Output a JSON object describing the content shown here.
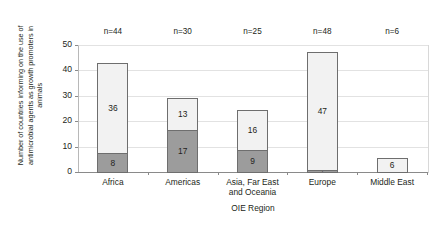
{
  "chart_data": {
    "type": "bar",
    "subtype": "stacked-column",
    "title": "",
    "xlabel": "OIE Region",
    "ylabel": "Number of countries informing on the use of antimicrobial agents as growth promoters in animals",
    "ylabel_lines": [
      "Number of countries informing on the use of",
      "antimicrobial agents as growth promoters in",
      "animals"
    ],
    "categories": [
      "Africa",
      "Americas",
      "Asia, Far East and Oceania",
      "Europe",
      "Middle East"
    ],
    "category_lines": [
      [
        "Africa"
      ],
      [
        "Americas"
      ],
      [
        "Asia, Far East",
        "and Oceania"
      ],
      [
        "Europe"
      ],
      [
        "Middle East"
      ]
    ],
    "series": [
      {
        "name": "lower-segment",
        "color": "#9c9c9c",
        "values": [
          8,
          17,
          9,
          1,
          0
        ],
        "labels": [
          "8",
          "17",
          "9",
          "1",
          ""
        ]
      },
      {
        "name": "upper-segment",
        "color": "#f2f2f2",
        "values": [
          36,
          13,
          16,
          47,
          6
        ],
        "labels": [
          "36",
          "13",
          "16",
          "47",
          "6"
        ]
      }
    ],
    "totals": [
      44,
      30,
      25,
      48,
      6
    ],
    "annotations": [
      "n=44",
      "n=30",
      "n=25",
      "n=48",
      "n=6"
    ],
    "ylim": [
      0,
      50
    ],
    "yticks": [
      0,
      10,
      20,
      30,
      40,
      50
    ],
    "ytick_labels": [
      "0",
      "10",
      "20",
      "30",
      "40",
      "50"
    ],
    "grid": true,
    "legend": "none",
    "colors": {
      "segment_light": "#f2f2f2",
      "segment_dark": "#9c9c9c",
      "bar_border": "#6e6e6e",
      "gridline": "#e2e2e2",
      "axis": "#8a8a8a",
      "text": "#231f20",
      "background": "#ffffff"
    }
  }
}
